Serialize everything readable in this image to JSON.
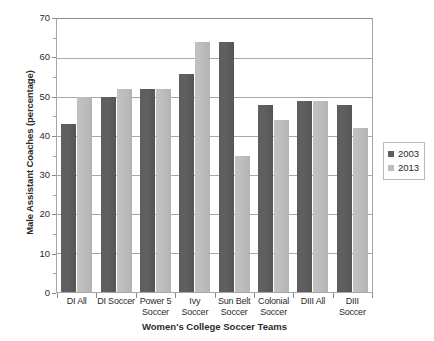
{
  "chart_data": {
    "type": "bar",
    "title": "",
    "xlabel": "Women's College Soccer Teams",
    "ylabel": "Male Assistant Coaches (percentage)",
    "ylim": [
      0,
      70
    ],
    "ytick_step": 10,
    "ytick_labels": [
      "70",
      "60",
      "50",
      "40",
      "30",
      "20",
      "10",
      "0"
    ],
    "grid": true,
    "legend_position": "right",
    "categories": [
      "DI All",
      "DI Soccer",
      "Power 5 Soccer",
      "Ivy Soccer",
      "Sun Belt Soccer",
      "Colonial Soccer",
      "DIII All",
      "DIII Soccer"
    ],
    "category_lines": [
      [
        "DI All"
      ],
      [
        "DI Soccer"
      ],
      [
        "Power 5",
        "Soccer"
      ],
      [
        "Ivy Soccer"
      ],
      [
        "Sun Belt",
        "Soccer"
      ],
      [
        "Colonial",
        "Soccer"
      ],
      [
        "DIII All"
      ],
      [
        "DIII",
        "Soccer"
      ]
    ],
    "series": [
      {
        "name": "2003",
        "color": "#5e5e5e",
        "values": [
          43,
          50,
          52,
          56,
          64,
          48,
          49,
          48
        ]
      },
      {
        "name": "2013",
        "color": "#bdbdbd",
        "values": [
          50,
          52,
          52,
          64,
          35,
          44,
          49,
          42
        ]
      }
    ]
  },
  "legend": {
    "items": [
      {
        "label": "2003",
        "swatch": "legend-swatch-2003"
      },
      {
        "label": "2013",
        "swatch": "legend-swatch-2013"
      }
    ]
  }
}
